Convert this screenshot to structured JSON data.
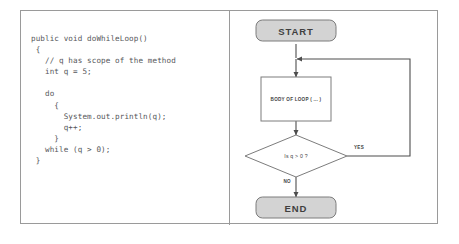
{
  "figure": {
    "code_panel": {
      "language": "java",
      "code": "public void doWhileLoop()\n {\n   // q has scope of the method\n   int q = 5;\n\n   do\n     {\n       System.out.println(q);\n       q++;\n     }\n   while (q > 0);\n }"
    },
    "flowchart": {
      "nodes": {
        "start": "START",
        "body": "BODY OF LOOP ( ... )",
        "decision": "Is q > 0 ?",
        "end": "END"
      },
      "edges": {
        "yes": "YES",
        "no": "NO"
      },
      "colors": {
        "terminal_fill": "#d3d3d3",
        "terminal_stroke": "#7c7c7c",
        "process_fill": "#ffffff",
        "process_stroke": "#7c7c7c",
        "decision_fill": "#ffffff",
        "decision_stroke": "#7c7c7c",
        "connector": "#4d4d4d",
        "frame": "#9a9a9a"
      }
    }
  }
}
